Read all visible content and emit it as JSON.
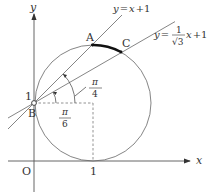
{
  "axes": {
    "x_label": "x",
    "y_label": "y",
    "origin_label": "O",
    "x_tick_label": "1",
    "y_tick_label": "1"
  },
  "points": {
    "A": "A",
    "B": "B",
    "C": "C"
  },
  "lines": {
    "line1": {
      "lhs": "y",
      "eq": "=",
      "rhs": "x",
      "plus": "+1"
    },
    "line2": {
      "lhs": "y",
      "eq": "=",
      "num": "1",
      "den": "√3",
      "rhs": "x",
      "plus": "+1"
    }
  },
  "angles": {
    "pi_over_4": {
      "num": "π",
      "den": "4"
    },
    "pi_over_6": {
      "num": "π",
      "den": "6"
    }
  },
  "circle": {
    "center": [
      1,
      1
    ],
    "radius": 1
  },
  "colors": {
    "axis": "#555555",
    "line": "#666666",
    "highlight_arc": "#111111"
  }
}
